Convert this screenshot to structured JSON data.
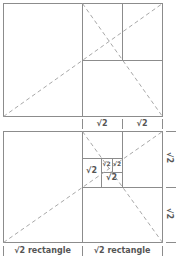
{
  "colors": {
    "line": "#8c8c8c",
    "dash": "#a8a8a8",
    "text": "#555555"
  },
  "top_diagram": {
    "labels": [
      "√2",
      "√2"
    ]
  },
  "bottom_diagram": {
    "inner_labels": [
      "√2",
      "√2",
      "√2",
      "√2"
    ],
    "side_labels": [
      "√2",
      "√2"
    ],
    "bottom_labels": [
      "√2 rectangle",
      "√2 rectangle"
    ]
  }
}
